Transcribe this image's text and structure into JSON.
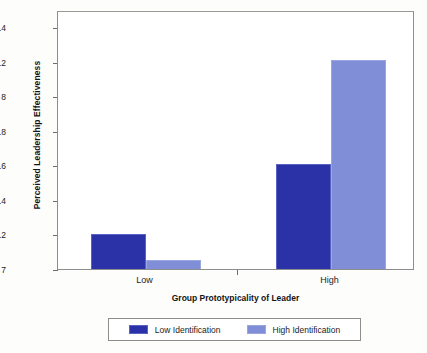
{
  "chart_data": {
    "type": "bar",
    "title": "",
    "xlabel": "Group Prototypicality of Leader",
    "ylabel": "Perceived Leadership Effectiveness",
    "categories": [
      "Low",
      "High"
    ],
    "series": [
      {
        "name": "Low Identification",
        "values": [
          7.2,
          7.61
        ],
        "color": "#2b31a6"
      },
      {
        "name": "High Identification",
        "values": [
          7.05,
          8.21
        ],
        "color": "#7f8ed6"
      }
    ],
    "ylim": [
      7,
      8.5
    ],
    "yticks": [
      "7",
      "7.2",
      "7.4",
      "7.6",
      "7.8",
      "8",
      "8.2",
      "8.4"
    ],
    "ytick_values": [
      7,
      7.2,
      7.4,
      7.6,
      7.8,
      8,
      8.2,
      8.4
    ],
    "grid": false,
    "legend_position": "bottom"
  },
  "legend": {
    "entries": [
      {
        "label": "Low Identification",
        "swatch": "dark-blue-swatch"
      },
      {
        "label": "High Identification",
        "swatch": "light-blue-swatch"
      }
    ]
  },
  "colors": {
    "series_low_identification": "#2b31a6",
    "series_high_identification": "#7f8ed6",
    "axis": "#8d8d8d",
    "background": "#ffffff"
  }
}
